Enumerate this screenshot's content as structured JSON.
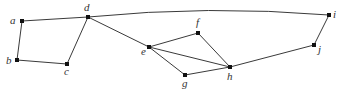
{
  "diagram": {
    "type": "undirected-graph",
    "nodes": [
      {
        "id": "a",
        "label": "a",
        "x": 22,
        "y": 21,
        "lx": 10,
        "ly": 24
      },
      {
        "id": "b",
        "label": "b",
        "x": 17,
        "y": 60,
        "lx": 6,
        "ly": 64
      },
      {
        "id": "c",
        "label": "c",
        "x": 67,
        "y": 64,
        "lx": 64,
        "ly": 75
      },
      {
        "id": "d",
        "label": "d",
        "x": 88,
        "y": 17,
        "lx": 84,
        "ly": 11
      },
      {
        "id": "e",
        "label": "e",
        "x": 149,
        "y": 47,
        "lx": 141,
        "ly": 55
      },
      {
        "id": "f",
        "label": "f",
        "x": 198,
        "y": 33,
        "lx": 196,
        "ly": 26
      },
      {
        "id": "g",
        "label": "g",
        "x": 185,
        "y": 75,
        "lx": 182,
        "ly": 87
      },
      {
        "id": "h",
        "label": "h",
        "x": 230,
        "y": 67,
        "lx": 227,
        "ly": 80
      },
      {
        "id": "i",
        "label": "i",
        "x": 329,
        "y": 15,
        "lx": 333,
        "ly": 18
      },
      {
        "id": "j",
        "label": "j",
        "x": 314,
        "y": 45,
        "lx": 318,
        "ly": 53
      }
    ],
    "edges": [
      {
        "from": "a",
        "to": "b"
      },
      {
        "from": "a",
        "to": "d"
      },
      {
        "from": "b",
        "to": "c"
      },
      {
        "from": "c",
        "to": "d"
      },
      {
        "from": "d",
        "to": "e"
      },
      {
        "from": "d",
        "to": "i",
        "curved": true
      },
      {
        "from": "e",
        "to": "f"
      },
      {
        "from": "e",
        "to": "g"
      },
      {
        "from": "e",
        "to": "h"
      },
      {
        "from": "f",
        "to": "h"
      },
      {
        "from": "g",
        "to": "h"
      },
      {
        "from": "h",
        "to": "j"
      },
      {
        "from": "i",
        "to": "j"
      }
    ]
  }
}
